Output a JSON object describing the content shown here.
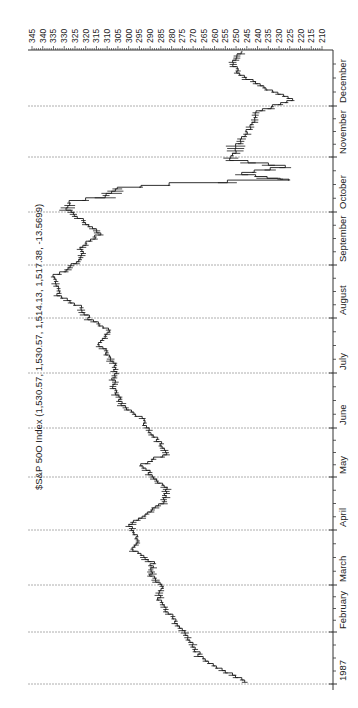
{
  "chart_data": {
    "type": "line",
    "subtype": "ohlc-bar (rotated 90° clockwise: price on horizontal axis increasing leftward, time on vertical axis increasing upward)",
    "title": "$S&P 50O Index (1,530.57, 1,530.57, 1,514.13, 1,517.38, -13.5699)",
    "xlabel": "",
    "ylabel": "",
    "price_axis": {
      "ticks": [
        345,
        340,
        335,
        330,
        325,
        320,
        315,
        310,
        305,
        300,
        295,
        290,
        285,
        280,
        275,
        270,
        265,
        260,
        255,
        250,
        245,
        240,
        235,
        230,
        225,
        220,
        215,
        210
      ],
      "range": [
        210,
        345
      ]
    },
    "time_axis": {
      "labels": [
        "1987",
        "February",
        "March",
        "April",
        "May",
        "June",
        "July",
        "August",
        "September",
        "October",
        "November",
        "December"
      ]
    },
    "grid": "dashed lines at each month start",
    "series": [
      {
        "name": "S&P 500 1987 (approx. close, ~weekly samples)",
        "x": [
          "Jan-02",
          "Jan-09",
          "Jan-16",
          "Jan-23",
          "Jan-30",
          "Feb-06",
          "Feb-13",
          "Feb-20",
          "Feb-27",
          "Mar-06",
          "Mar-13",
          "Mar-20",
          "Mar-27",
          "Apr-03",
          "Apr-10",
          "Apr-17",
          "Apr-24",
          "May-01",
          "May-08",
          "May-15",
          "May-22",
          "May-29",
          "Jun-05",
          "Jun-12",
          "Jun-19",
          "Jun-26",
          "Jul-03",
          "Jul-10",
          "Jul-17",
          "Jul-24",
          "Jul-31",
          "Aug-07",
          "Aug-14",
          "Aug-21",
          "Aug-25",
          "Aug-28",
          "Sep-04",
          "Sep-11",
          "Sep-18",
          "Sep-25",
          "Oct-02",
          "Oct-06",
          "Oct-09",
          "Oct-14",
          "Oct-16",
          "Oct-19",
          "Oct-20",
          "Oct-22",
          "Oct-26",
          "Oct-30",
          "Nov-06",
          "Nov-13",
          "Nov-20",
          "Nov-27",
          "Dec-04",
          "Dec-11",
          "Dec-18",
          "Dec-24",
          "Dec-31"
        ],
        "values": [
          246,
          257,
          266,
          270,
          274,
          278,
          282,
          286,
          284,
          290,
          289,
          298,
          296,
          300,
          292,
          283,
          282,
          289,
          294,
          283,
          285,
          291,
          293,
          302,
          306,
          307,
          306,
          309,
          314,
          309,
          318,
          323,
          333,
          334,
          336,
          330,
          322,
          322,
          314,
          320,
          329,
          328,
          312,
          305,
          282,
          225,
          236,
          248,
          228,
          252,
          250,
          246,
          242,
          240,
          224,
          238,
          248,
          252,
          247
        ]
      }
    ]
  },
  "layout": {
    "axis_y_px": 50,
    "plot_left_px": 28,
    "plot_right_px": 333,
    "price_px_at_345": 32,
    "price_px_at_210": 322,
    "month_lines_px": {
      "1987": 684,
      "February": 632,
      "March": 585,
      "April": 530,
      "May": 477,
      "June": 428,
      "July": 373,
      "August": 318,
      "September": 265,
      "October": 212,
      "November": 157,
      "December": 106,
      "end": 50
    },
    "colors": {
      "line": "#1a1a1a",
      "grid": "#9a9a9a",
      "axis": "#333333",
      "text": "#222222",
      "background": "#ffffff"
    }
  }
}
